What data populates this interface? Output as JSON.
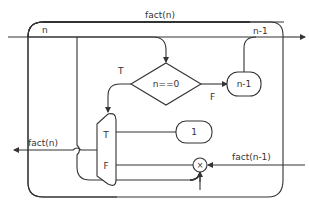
{
  "diagram": {
    "colors": {
      "stroke": "#333333",
      "background": "#ffffff",
      "text": "#333333"
    },
    "labels": {
      "outer_loop": "fact(n)",
      "input_n": "n",
      "recursive_out": "n-1",
      "branch_true": "T",
      "branch_false": "F",
      "output": "fact(n)",
      "recursive_in": "fact(n-1)"
    },
    "nodes": {
      "decision": {
        "label": "n==0",
        "shape": "diamond"
      },
      "decrement": {
        "label": "n-1",
        "shape": "rounded-rect"
      },
      "constant": {
        "label": "1",
        "shape": "rounded-rect"
      },
      "mux": {
        "true_label": "T",
        "false_label": "F",
        "shape": "multiplexer"
      },
      "multiply": {
        "symbol": "×",
        "shape": "circle"
      }
    }
  }
}
